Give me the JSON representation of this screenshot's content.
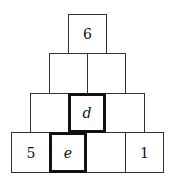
{
  "pyramid": {
    "rows": [
      [
        {
          "text": "6",
          "bold": false,
          "italic": false
        }
      ],
      [
        {
          "text": "",
          "bold": false,
          "italic": false
        },
        {
          "text": "",
          "bold": false,
          "italic": false
        }
      ],
      [
        {
          "text": "",
          "bold": false,
          "italic": false
        },
        {
          "text": "d",
          "bold": true,
          "italic": true
        },
        {
          "text": "",
          "bold": false,
          "italic": false
        }
      ],
      [
        {
          "text": "5",
          "bold": false,
          "italic": false
        },
        {
          "text": "e",
          "bold": true,
          "italic": true
        },
        {
          "text": "",
          "bold": false,
          "italic": false
        },
        {
          "text": "1",
          "bold": false,
          "italic": false
        }
      ]
    ]
  }
}
